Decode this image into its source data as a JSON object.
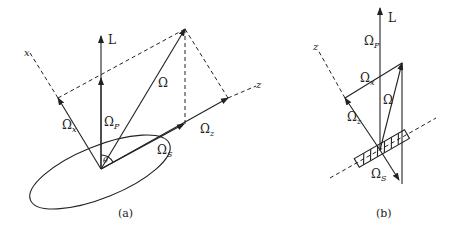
{
  "figure": {
    "panel_a": {
      "caption": "(a)",
      "labels": {
        "L": "L",
        "omega": "Ω",
        "omega_p": "Ω",
        "omega_p_sub": "P",
        "omega_x": "Ω",
        "omega_x_sub": "x",
        "omega_z": "Ω",
        "omega_z_sub": "z",
        "omega_s": "Ω",
        "omega_s_sub": "S",
        "theta": "θ",
        "axis_x": "x",
        "axis_z": "z"
      }
    },
    "panel_b": {
      "caption": "(b)",
      "labels": {
        "L": "L",
        "omega": "Ω",
        "omega_p": "Ω",
        "omega_p_sub": "P",
        "omega_x": "Ω",
        "omega_x_sub": "x",
        "omega_z": "Ω",
        "omega_z_sub": "z",
        "omega_s": "Ω",
        "omega_s_sub": "S",
        "axis_z": "z"
      }
    },
    "colors": {
      "ink": "#222222",
      "background": "#ffffff"
    }
  }
}
